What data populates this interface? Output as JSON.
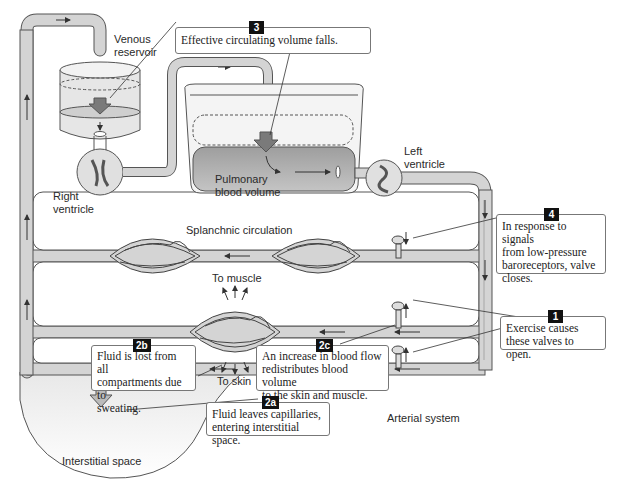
{
  "labels": {
    "venous_reservoir": [
      "Venous",
      "reservoir"
    ],
    "right_ventricle": [
      "Right",
      "ventricle"
    ],
    "pulmonary_blood_volume": [
      "Pulmonary",
      "blood volume"
    ],
    "left_ventricle": [
      "Left",
      "ventricle"
    ],
    "splanchnic_circulation": "Splanchnic circulation",
    "to_muscle": "To muscle",
    "to_skin": "To skin",
    "arterial_system": "Arterial system",
    "interstitial_space": "Interstitial space"
  },
  "callouts": [
    {
      "id": "3",
      "text": "Effective circulating volume falls."
    },
    {
      "id": "4",
      "lines": [
        "In response to signals",
        "from low-pressure",
        "baroreceptors, valve",
        "closes."
      ]
    },
    {
      "id": "1",
      "lines": [
        "Exercise causes",
        "these valves to open."
      ]
    },
    {
      "id": "2b",
      "lines": [
        "Fluid is lost from all",
        "compartments due to",
        "sweating."
      ]
    },
    {
      "id": "2c",
      "lines": [
        "An increase in blood flow",
        "redistributes blood volume",
        "to the skin and muscle."
      ]
    },
    {
      "id": "2a",
      "lines": [
        "Fluid leaves capillaries,",
        "entering interstitial space."
      ]
    }
  ],
  "colors": {
    "pipe_fill": "#d4d4d4",
    "pipe_stroke": "#555555",
    "blood": "#a9a9a9",
    "arrow_big": "#7a7a7a",
    "badge": "#111111"
  }
}
